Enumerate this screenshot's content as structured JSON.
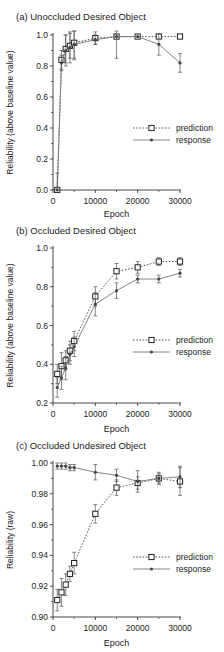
{
  "figure": {
    "x_axis_label": "Epoch",
    "x_ticks": [
      0,
      10000,
      20000,
      30000
    ],
    "legend": {
      "prediction_label": "prediction",
      "response_label": "response"
    }
  },
  "chart_data": [
    {
      "type": "line",
      "title": "(a) Unoccluded Desired Object",
      "xlabel": "Epoch",
      "ylabel": "Reliability (above baseline value)",
      "xlim": [
        0,
        30000
      ],
      "ylim": [
        0.0,
        1.0
      ],
      "y_ticks": [
        0.0,
        0.2,
        0.4,
        0.6,
        0.8,
        1.0
      ],
      "y_tick_labels": [
        "0.0",
        "0.2",
        "0.4",
        "0.6",
        "0.8",
        "1.0"
      ],
      "grid": false,
      "legend_position": "right-middle",
      "series": [
        {
          "name": "prediction",
          "style": "dotted line, open square markers",
          "x": [
            1000,
            2000,
            3000,
            4000,
            5000,
            10000,
            15000,
            20000,
            25000,
            30000
          ],
          "y": [
            0.0,
            0.84,
            0.91,
            0.93,
            0.95,
            0.98,
            0.99,
            0.99,
            0.99,
            0.99
          ],
          "err": [
            0.0,
            0.06,
            0.09,
            0.08,
            0.1,
            0.04,
            0.0,
            0.0,
            0.0,
            0.0
          ]
        },
        {
          "name": "response",
          "style": "solid line, filled dot markers",
          "x": [
            1000,
            2000,
            3000,
            4000,
            5000,
            10000,
            15000,
            20000,
            25000,
            30000
          ],
          "y": [
            0.0,
            0.82,
            0.9,
            0.92,
            0.94,
            0.97,
            0.99,
            0.99,
            0.94,
            0.82
          ],
          "err": [
            0.11,
            0.05,
            0.1,
            0.1,
            0.1,
            0.03,
            0.14,
            0.0,
            0.07,
            0.06
          ]
        }
      ]
    },
    {
      "type": "line",
      "title": "(b) Occluded Desired Object",
      "xlabel": "Epoch",
      "ylabel": "Reliability (above baseline value)",
      "xlim": [
        0,
        30000
      ],
      "ylim": [
        0.2,
        1.0
      ],
      "y_ticks": [
        0.2,
        0.4,
        0.6,
        0.8,
        1.0
      ],
      "y_tick_labels": [
        "0.2",
        "0.4",
        "0.6",
        "0.8",
        "1.0"
      ],
      "grid": false,
      "legend_position": "right-middle",
      "series": [
        {
          "name": "prediction",
          "style": "dotted line, open square markers",
          "x": [
            1000,
            2000,
            3000,
            4000,
            5000,
            10000,
            15000,
            20000,
            25000,
            30000
          ],
          "y": [
            0.35,
            0.39,
            0.42,
            0.47,
            0.52,
            0.75,
            0.88,
            0.9,
            0.93,
            0.93
          ],
          "err": [
            0.05,
            0.07,
            0.05,
            0.05,
            0.05,
            0.05,
            0.04,
            0.03,
            0.02,
            0.02
          ]
        },
        {
          "name": "response",
          "style": "solid line, filled dot markers",
          "x": [
            1000,
            2000,
            3000,
            4000,
            5000,
            10000,
            15000,
            20000,
            25000,
            30000
          ],
          "y": [
            0.28,
            0.33,
            0.38,
            0.45,
            0.49,
            0.71,
            0.78,
            0.84,
            0.84,
            0.87
          ],
          "err": [
            0.05,
            0.06,
            0.06,
            0.05,
            0.05,
            0.06,
            0.04,
            0.02,
            0.02,
            0.02
          ]
        }
      ]
    },
    {
      "type": "line",
      "title": "(c) Occluded Undesired Object",
      "xlabel": "Epoch",
      "ylabel": "Reliability (raw)",
      "xlim": [
        0,
        30000
      ],
      "ylim": [
        0.9,
        1.0
      ],
      "y_ticks": [
        0.9,
        0.92,
        0.94,
        0.96,
        0.98,
        1.0
      ],
      "y_tick_labels": [
        "0.90",
        "0.92",
        "0.94",
        "0.96",
        "0.98",
        "1.00"
      ],
      "grid": false,
      "legend_position": "right-lower",
      "series": [
        {
          "name": "prediction",
          "style": "dotted line, open square markers",
          "x": [
            1000,
            2000,
            3000,
            4000,
            5000,
            10000,
            15000,
            20000,
            25000,
            30000
          ],
          "y": [
            0.911,
            0.916,
            0.921,
            0.928,
            0.935,
            0.967,
            0.984,
            0.987,
            0.99,
            0.988
          ],
          "err": [
            0.007,
            0.009,
            0.007,
            0.005,
            0.007,
            0.006,
            0.005,
            0.004,
            0.003,
            0.009
          ]
        },
        {
          "name": "response",
          "style": "solid line, filled dot markers",
          "x": [
            1000,
            2000,
            3000,
            4000,
            5000,
            10000,
            15000,
            20000,
            25000,
            30000
          ],
          "y": [
            0.998,
            0.998,
            0.998,
            0.997,
            0.997,
            0.994,
            0.992,
            0.988,
            0.99,
            0.991
          ],
          "err": [
            0.002,
            0.002,
            0.002,
            0.002,
            0.002,
            0.005,
            0.004,
            0.007,
            0.004,
            0.007
          ]
        }
      ]
    }
  ]
}
